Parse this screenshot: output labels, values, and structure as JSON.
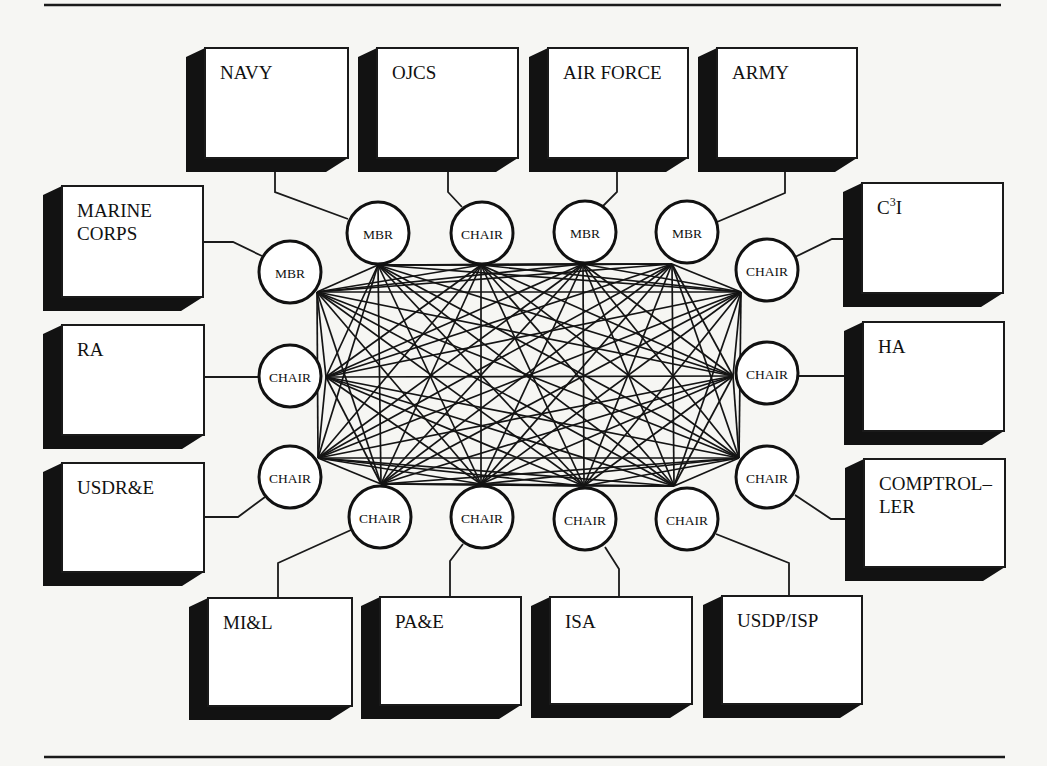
{
  "figure": {
    "type": "network-diagram"
  },
  "colors": {
    "background": "#f6f6f3",
    "ink": "#111111",
    "box_fill": "#ffffff"
  },
  "rules": [
    {
      "x1": 44,
      "y1": 5,
      "x2": 1001,
      "y2": 5
    },
    {
      "x1": 44,
      "y1": 757,
      "x2": 1005,
      "y2": 757
    }
  ],
  "shadow": {
    "dx": 19,
    "dy": 14
  },
  "boxes": [
    {
      "id": "navy",
      "lines": [
        "NAVY"
      ],
      "x": 205,
      "y": 48,
      "w": 143,
      "h": 110
    },
    {
      "id": "ojcs",
      "lines": [
        "OJCS"
      ],
      "x": 377,
      "y": 48,
      "w": 141,
      "h": 110
    },
    {
      "id": "air-force",
      "lines": [
        "AIR FORCE"
      ],
      "x": 548,
      "y": 48,
      "w": 140,
      "h": 110
    },
    {
      "id": "army",
      "lines": [
        "ARMY"
      ],
      "x": 717,
      "y": 48,
      "w": 140,
      "h": 110
    },
    {
      "id": "marine-corps",
      "lines": [
        "MARINE",
        "CORPS"
      ],
      "x": 62,
      "y": 186,
      "w": 141,
      "h": 111
    },
    {
      "id": "ra",
      "lines": [
        "RA"
      ],
      "x": 62,
      "y": 325,
      "w": 142,
      "h": 110
    },
    {
      "id": "usdre",
      "lines": [
        "USDR&E"
      ],
      "x": 62,
      "y": 463,
      "w": 142,
      "h": 109
    },
    {
      "id": "c3i",
      "lines": [
        "C"
      ],
      "sup": "3",
      "suffix": "I",
      "x": 862,
      "y": 183,
      "w": 141,
      "h": 110
    },
    {
      "id": "ha",
      "lines": [
        "HA"
      ],
      "x": 863,
      "y": 322,
      "w": 141,
      "h": 109
    },
    {
      "id": "comptroller",
      "lines": [
        "COMPTROL–",
        "LER"
      ],
      "x": 864,
      "y": 459,
      "w": 141,
      "h": 108
    },
    {
      "id": "mil",
      "lines": [
        "MI&L"
      ],
      "x": 208,
      "y": 598,
      "w": 144,
      "h": 108
    },
    {
      "id": "pae",
      "lines": [
        "PA&E"
      ],
      "x": 380,
      "y": 597,
      "w": 141,
      "h": 108
    },
    {
      "id": "isa",
      "lines": [
        "ISA"
      ],
      "x": 550,
      "y": 597,
      "w": 142,
      "h": 107
    },
    {
      "id": "usdp-isp",
      "lines": [
        "USDP/ISP"
      ],
      "x": 722,
      "y": 596,
      "w": 140,
      "h": 108
    }
  ],
  "nodes": [
    {
      "id": "navy-node",
      "label": "MBR",
      "cx": 378,
      "cy": 233,
      "ax": 378,
      "ay": 265
    },
    {
      "id": "ojcs-node",
      "label": "CHAIR",
      "cx": 482,
      "cy": 233,
      "ax": 481,
      "ay": 265
    },
    {
      "id": "air-force-node",
      "label": "MBR",
      "cx": 585,
      "cy": 232,
      "ax": 583,
      "ay": 264
    },
    {
      "id": "army-node",
      "label": "MBR",
      "cx": 687,
      "cy": 232,
      "ax": 672,
      "ay": 264
    },
    {
      "id": "marine-corps-node",
      "label": "MBR",
      "cx": 290,
      "cy": 272,
      "ax": 317,
      "ay": 292
    },
    {
      "id": "ra-node",
      "label": "CHAIR",
      "cx": 290,
      "cy": 376,
      "ax": 326,
      "ay": 377
    },
    {
      "id": "usdre-node",
      "label": "CHAIR",
      "cx": 290,
      "cy": 477,
      "ax": 318,
      "ay": 458
    },
    {
      "id": "c3i-node",
      "label": "CHAIR",
      "cx": 767,
      "cy": 270,
      "ax": 741,
      "ay": 292
    },
    {
      "id": "ha-node",
      "label": "CHAIR",
      "cx": 767,
      "cy": 373,
      "ax": 733,
      "ay": 376
    },
    {
      "id": "comptroller-node",
      "label": "CHAIR",
      "cx": 767,
      "cy": 477,
      "ax": 739,
      "ay": 458
    },
    {
      "id": "mil-node",
      "label": "CHAIR",
      "cx": 380,
      "cy": 517,
      "ax": 381,
      "ay": 484
    },
    {
      "id": "pae-node",
      "label": "CHAIR",
      "cx": 482,
      "cy": 517,
      "ax": 481,
      "ay": 484
    },
    {
      "id": "isa-node",
      "label": "CHAIR",
      "cx": 585,
      "cy": 519,
      "ax": 584,
      "ay": 486
    },
    {
      "id": "usdp-isp-node",
      "label": "CHAIR",
      "cx": 687,
      "cy": 519,
      "ax": 674,
      "ay": 486
    }
  ],
  "node_radius": 31,
  "connectors": [
    {
      "from": "navy",
      "to": "navy-node",
      "points": [
        [
          275,
          172
        ],
        [
          275,
          192
        ],
        [
          348,
          219
        ]
      ]
    },
    {
      "from": "ojcs",
      "to": "ojcs-node",
      "points": [
        [
          448,
          172
        ],
        [
          448,
          192
        ],
        [
          462,
          207
        ]
      ]
    },
    {
      "from": "air-force",
      "to": "air-force-node",
      "points": [
        [
          617,
          172
        ],
        [
          617,
          192
        ],
        [
          603,
          206
        ]
      ]
    },
    {
      "from": "army",
      "to": "army-node",
      "points": [
        [
          785,
          172
        ],
        [
          785,
          193
        ],
        [
          717,
          222
        ]
      ]
    },
    {
      "from": "marine-corps",
      "to": "marine-corps-node",
      "points": [
        [
          203,
          242
        ],
        [
          233,
          242
        ],
        [
          262,
          256
        ]
      ]
    },
    {
      "from": "ra",
      "to": "ra-node",
      "points": [
        [
          204,
          377
        ],
        [
          259,
          377
        ]
      ]
    },
    {
      "from": "usdre",
      "to": "usdre-node",
      "points": [
        [
          204,
          517
        ],
        [
          238,
          517
        ],
        [
          265,
          497
        ]
      ]
    },
    {
      "from": "c3i",
      "to": "c3i-node",
      "points": [
        [
          843,
          239
        ],
        [
          832,
          239
        ],
        [
          795,
          257
        ]
      ]
    },
    {
      "from": "ha",
      "to": "ha-node",
      "points": [
        [
          844,
          376
        ],
        [
          798,
          376
        ]
      ]
    },
    {
      "from": "comptroller",
      "to": "comptroller-node",
      "points": [
        [
          845,
          519
        ],
        [
          831,
          519
        ],
        [
          795,
          495
        ]
      ]
    },
    {
      "from": "mil",
      "to": "mil-node",
      "points": [
        [
          278,
          598
        ],
        [
          278,
          563
        ],
        [
          351,
          530
        ]
      ]
    },
    {
      "from": "pae",
      "to": "pae-node",
      "points": [
        [
          450,
          597
        ],
        [
          450,
          561
        ],
        [
          463,
          544
        ]
      ]
    },
    {
      "from": "isa",
      "to": "isa-node",
      "points": [
        [
          619,
          597
        ],
        [
          619,
          569
        ],
        [
          605,
          547
        ]
      ]
    },
    {
      "from": "usdp-isp",
      "to": "usdp-isp-node",
      "points": [
        [
          789,
          596
        ],
        [
          789,
          563
        ],
        [
          716,
          534
        ]
      ]
    }
  ],
  "network": {
    "topology": "complete-graph",
    "node_count": 14,
    "edge_count": 91
  }
}
